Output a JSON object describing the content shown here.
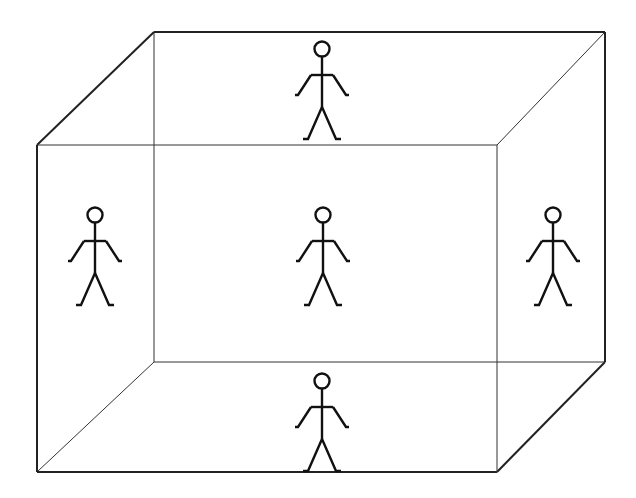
{
  "diagram": {
    "title": "",
    "colors": {
      "background": "#ffffff",
      "line": "#222222"
    },
    "box": {
      "front": {
        "x1": 37,
        "y1": 145,
        "x2": 497,
        "y2": 472
      },
      "back": {
        "x1": 154,
        "y1": 32,
        "x2": 605,
        "y2": 362
      }
    },
    "figures": [
      {
        "id": "top",
        "face": "ceiling",
        "cx": 322,
        "head_y": 48
      },
      {
        "id": "left",
        "face": "left-wall",
        "cx": 95,
        "head_y": 215
      },
      {
        "id": "center",
        "face": "back-wall",
        "cx": 323,
        "head_y": 215
      },
      {
        "id": "right",
        "face": "right-wall",
        "cx": 553,
        "head_y": 215
      },
      {
        "id": "bottom",
        "face": "floor",
        "cx": 322,
        "head_y": 380
      }
    ]
  }
}
